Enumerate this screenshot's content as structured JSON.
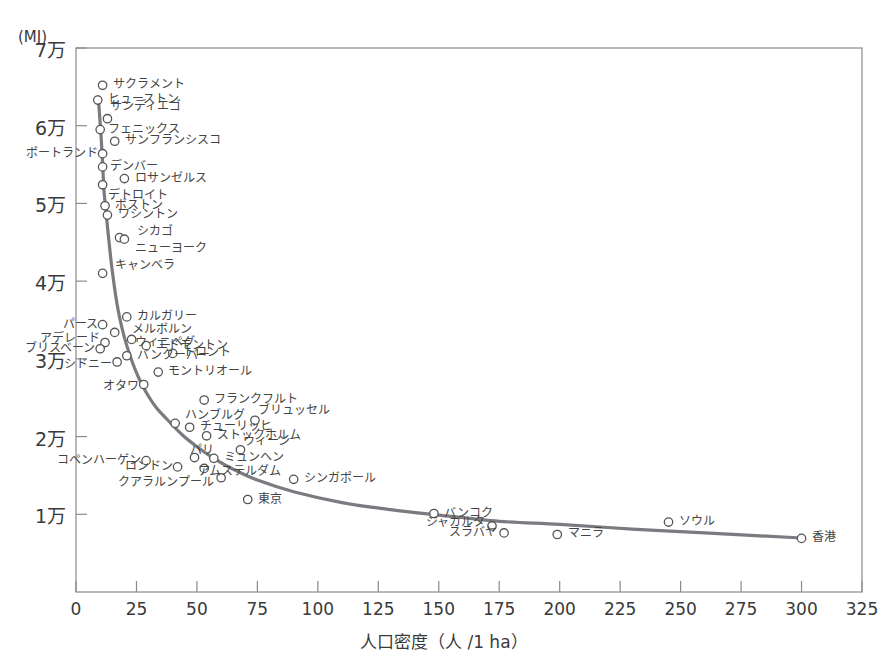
{
  "chart_data": {
    "type": "scatter",
    "title": "",
    "subtitle": "",
    "xlabel": "人口密度（人 /1 ha）",
    "ylabel": "",
    "yunit": "(MJ)",
    "xlim": [
      0,
      325
    ],
    "ylim": [
      0,
      70000
    ],
    "grid": false,
    "legend": null,
    "xticks": [
      0,
      25,
      50,
      75,
      100,
      125,
      150,
      175,
      200,
      225,
      250,
      275,
      300,
      325
    ],
    "xticklabels": [
      "0",
      "25",
      "50",
      "75",
      "100",
      "125",
      "150",
      "175",
      "200",
      "225",
      "250",
      "275",
      "300",
      "325"
    ],
    "yticks": [
      10000,
      20000,
      30000,
      40000,
      50000,
      60000,
      70000
    ],
    "yticklabels": [
      "1万",
      "2万",
      "3万",
      "4万",
      "5万",
      "6万",
      "7万"
    ],
    "points": [
      {
        "label": "サクラメント",
        "x": 11,
        "y": 65200,
        "lx": 14,
        "ly": 65200,
        "anchor": "left"
      },
      {
        "label": "ヒューストン",
        "x": 9,
        "y": 63300,
        "lx": 12,
        "ly": 63300,
        "anchor": "left"
      },
      {
        "label": "サンディエゴ",
        "x": 13,
        "y": 60900,
        "lx": 13,
        "ly": 62400,
        "anchor": "left"
      },
      {
        "label": "フェニックス",
        "x": 10,
        "y": 59500,
        "lx": 12,
        "ly": 59500,
        "anchor": "left"
      },
      {
        "label": "サンフランシスコ",
        "x": 16,
        "y": 58000,
        "lx": 19,
        "ly": 58000,
        "anchor": "left"
      },
      {
        "label": "ポートランド",
        "x": 11,
        "y": 56400,
        "lx": 9,
        "ly": 56400,
        "anchor": "right"
      },
      {
        "label": "デンバー",
        "x": 11,
        "y": 54700,
        "lx": 13,
        "ly": 54700,
        "anchor": "left"
      },
      {
        "label": "ロサンゼルス",
        "x": 20,
        "y": 53200,
        "lx": 23,
        "ly": 53200,
        "anchor": "left"
      },
      {
        "label": "デトロイト",
        "x": 11,
        "y": 52400,
        "lx": 12,
        "ly": 51000,
        "anchor": "left"
      },
      {
        "label": "ボストン",
        "x": 12,
        "y": 49700,
        "lx": 15,
        "ly": 49700,
        "anchor": "left"
      },
      {
        "label": "ワシントン",
        "x": 13,
        "y": 48500,
        "lx": 16,
        "ly": 48500,
        "anchor": "left"
      },
      {
        "label": "シカゴ",
        "x": 18,
        "y": 45600,
        "lx": 24,
        "ly": 46300,
        "anchor": "left"
      },
      {
        "label": "ニューヨーク",
        "x": 20,
        "y": 45400,
        "lx": 23,
        "ly": 44100,
        "anchor": "left"
      },
      {
        "label": "キャンベラ",
        "x": 11,
        "y": 41000,
        "lx": 15,
        "ly": 42000,
        "anchor": "left"
      },
      {
        "label": "カルガリー",
        "x": 21,
        "y": 35400,
        "lx": 24,
        "ly": 35400,
        "anchor": "left"
      },
      {
        "label": "パース",
        "x": 11,
        "y": 34400,
        "lx": 9,
        "ly": 34400,
        "anchor": "right"
      },
      {
        "label": "メルボルン",
        "x": 16,
        "y": 33400,
        "lx": 22,
        "ly": 33700,
        "anchor": "left"
      },
      {
        "label": "ウィニペグ",
        "x": 23,
        "y": 32500,
        "lx": 23,
        "ly": 32100,
        "anchor": "left"
      },
      {
        "label": "アデレード",
        "x": 12,
        "y": 32100,
        "lx": 10,
        "ly": 32600,
        "anchor": "right"
      },
      {
        "label": "エドモントン",
        "x": 29,
        "y": 31700,
        "lx": 32,
        "ly": 31700,
        "anchor": "left"
      },
      {
        "label": "ブリスベーン",
        "x": 10,
        "y": 31300,
        "lx": 8,
        "ly": 31300,
        "anchor": "right"
      },
      {
        "label": "バンクーバー",
        "x": 21,
        "y": 30400,
        "lx": 24,
        "ly": 30400,
        "anchor": "left"
      },
      {
        "label": "トロント",
        "x": 40,
        "y": 30700,
        "lx": 43,
        "ly": 30700,
        "anchor": "left"
      },
      {
        "label": "シドニー",
        "x": 17,
        "y": 29600,
        "lx": 15,
        "ly": 29200,
        "anchor": "right"
      },
      {
        "label": "モントリオール",
        "x": 34,
        "y": 28300,
        "lx": 37,
        "ly": 28300,
        "anchor": "left"
      },
      {
        "label": "オタワ",
        "x": 28,
        "y": 26700,
        "lx": 26,
        "ly": 26400,
        "anchor": "right"
      },
      {
        "label": "フランクフルト",
        "x": 53,
        "y": 24700,
        "lx": 56,
        "ly": 24700,
        "anchor": "left"
      },
      {
        "label": "ブリュッセル",
        "x": 74,
        "y": 22100,
        "lx": 74,
        "ly": 23300,
        "anchor": "left"
      },
      {
        "label": "ハンブルグ",
        "x": 41,
        "y": 21700,
        "lx": 44,
        "ly": 22700,
        "anchor": "left"
      },
      {
        "label": "チューリッヒ",
        "x": 47,
        "y": 21200,
        "lx": 50,
        "ly": 21200,
        "anchor": "left"
      },
      {
        "label": "ストックホルム",
        "x": 54,
        "y": 20100,
        "lx": 57,
        "ly": 20100,
        "anchor": "left"
      },
      {
        "label": "ウィーン",
        "x": 68,
        "y": 18300,
        "lx": 68,
        "ly": 19300,
        "anchor": "left"
      },
      {
        "label": "パリ",
        "x": 49,
        "y": 17300,
        "lx": 46,
        "ly": 18100,
        "anchor": "left"
      },
      {
        "label": "ミュンヘン",
        "x": 57,
        "y": 17200,
        "lx": 60,
        "ly": 17200,
        "anchor": "left"
      },
      {
        "label": "コペンハーゲン",
        "x": 29,
        "y": 16900,
        "lx": 27,
        "ly": 16900,
        "anchor": "right"
      },
      {
        "label": "ロンドン",
        "x": 42,
        "y": 16100,
        "lx": 40,
        "ly": 16100,
        "anchor": "right"
      },
      {
        "label": "アムステルダム",
        "x": 53,
        "y": 15900,
        "lx": 49,
        "ly": 15400,
        "anchor": "left"
      },
      {
        "label": "クアラルンプール",
        "x": 60,
        "y": 14700,
        "lx": 57,
        "ly": 14000,
        "anchor": "right"
      },
      {
        "label": "シンガポール",
        "x": 90,
        "y": 14500,
        "lx": 93,
        "ly": 14500,
        "anchor": "left"
      },
      {
        "label": "東京",
        "x": 71,
        "y": 11900,
        "lx": 74,
        "ly": 11900,
        "anchor": "left"
      },
      {
        "label": "バンコク",
        "x": 148,
        "y": 10100,
        "lx": 151,
        "ly": 10100,
        "anchor": "left"
      },
      {
        "label": "ジャカルタ",
        "x": 172,
        "y": 8500,
        "lx": 169,
        "ly": 8900,
        "anchor": "right"
      },
      {
        "label": "スラバヤ",
        "x": 177,
        "y": 7600,
        "lx": 174,
        "ly": 7600,
        "anchor": "right"
      },
      {
        "label": "マニラ",
        "x": 199,
        "y": 7400,
        "lx": 202,
        "ly": 7400,
        "anchor": "left"
      },
      {
        "label": "ソウル",
        "x": 245,
        "y": 9000,
        "lx": 248,
        "ly": 9000,
        "anchor": "left"
      },
      {
        "label": "香港",
        "x": 300,
        "y": 6900,
        "lx": 303,
        "ly": 6900,
        "anchor": "left"
      }
    ],
    "trend_curve": [
      {
        "x": 9.2,
        "y": 63700
      },
      {
        "x": 10.5,
        "y": 58000
      },
      {
        "x": 11.5,
        "y": 52000
      },
      {
        "x": 12.2,
        "y": 49600
      },
      {
        "x": 13.5,
        "y": 45500
      },
      {
        "x": 15.0,
        "y": 41300
      },
      {
        "x": 17.0,
        "y": 37000
      },
      {
        "x": 19.0,
        "y": 34000
      },
      {
        "x": 21.0,
        "y": 31700
      },
      {
        "x": 23.5,
        "y": 29400
      },
      {
        "x": 26.0,
        "y": 27500
      },
      {
        "x": 29.0,
        "y": 25700
      },
      {
        "x": 33.0,
        "y": 23800
      },
      {
        "x": 38.0,
        "y": 22100
      },
      {
        "x": 44.0,
        "y": 20200
      },
      {
        "x": 50.0,
        "y": 18700
      },
      {
        "x": 57.0,
        "y": 17200
      },
      {
        "x": 65.0,
        "y": 15800
      },
      {
        "x": 75.0,
        "y": 14400
      },
      {
        "x": 90.0,
        "y": 12900
      },
      {
        "x": 110.0,
        "y": 11500
      },
      {
        "x": 130.0,
        "y": 10600
      },
      {
        "x": 150.0,
        "y": 9900
      },
      {
        "x": 175.0,
        "y": 9100
      },
      {
        "x": 200.0,
        "y": 8700
      },
      {
        "x": 230.0,
        "y": 8100
      },
      {
        "x": 260.0,
        "y": 7600
      },
      {
        "x": 300.0,
        "y": 6950
      }
    ],
    "colors": {
      "curve": "#7a7a80",
      "marker_stroke": "#555555",
      "axis": "#8a8a8a",
      "text": "#3a3a3a"
    }
  }
}
